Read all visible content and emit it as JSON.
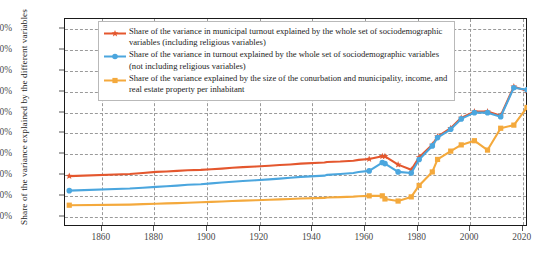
{
  "chart_data": {
    "type": "line",
    "title": "",
    "xlabel": "",
    "ylabel": "Share of the variance explained by the different variables",
    "xlim": [
      1846,
      2022
    ],
    "ylim": [
      5,
      105
    ],
    "grid": true,
    "legend_position": "top-left-inside",
    "x_ticks": [
      "1860",
      "1880",
      "1900",
      "1920",
      "1940",
      "1960",
      "1980",
      "2000",
      "2020"
    ],
    "x_tick_values": [
      1860,
      1880,
      1900,
      1920,
      1940,
      1960,
      1980,
      2000,
      2020
    ],
    "y_ticks": [
      "10%",
      "20%",
      "30%",
      "40%",
      "50%",
      "60%",
      "70%",
      "80%",
      "90%",
      "100%"
    ],
    "y_tick_values": [
      10,
      20,
      30,
      40,
      50,
      60,
      70,
      80,
      90,
      100
    ],
    "series": [
      {
        "name": "Share of the variance in municipal turnout explained by the whole set of sociodemographic variables (including religious variables)",
        "color": "#E4572E",
        "marker": "star",
        "x": [
          1848,
          1871,
          1876,
          1881,
          1885,
          1889,
          1893,
          1898,
          1902,
          1906,
          1910,
          1914,
          1919,
          1924,
          1928,
          1932,
          1936,
          1945,
          1946,
          1951,
          1956,
          1958,
          1962,
          1967,
          1968,
          1973,
          1978,
          1981,
          1986,
          1988,
          1993,
          1997,
          2002,
          2007,
          2012,
          2017,
          2022
        ],
        "y": [
          29,
          30,
          30.5,
          31,
          31.2,
          31.5,
          31.8,
          32,
          32.3,
          32.6,
          33,
          33.3,
          33.6,
          34,
          34.3,
          34.6,
          35,
          35.5,
          35.8,
          36,
          36.4,
          36.8,
          37.2,
          38.5,
          38.5,
          34.5,
          32,
          38,
          44,
          48,
          52,
          57,
          60,
          60,
          58,
          72,
          70
        ]
      },
      {
        "name": "Share of the variance in turnout explained by the whole set of sociodemographic variables (not including religious variables)",
        "color": "#4BA6DE",
        "marker": "circle",
        "x": [
          1848,
          1871,
          1876,
          1881,
          1885,
          1889,
          1893,
          1898,
          1902,
          1906,
          1910,
          1914,
          1919,
          1924,
          1928,
          1932,
          1936,
          1945,
          1946,
          1951,
          1956,
          1958,
          1962,
          1967,
          1968,
          1973,
          1978,
          1981,
          1986,
          1988,
          1993,
          1997,
          2002,
          2007,
          2012,
          2017,
          2022
        ],
        "y": [
          22,
          23,
          23.4,
          23.8,
          24.1,
          24.4,
          24.8,
          25.1,
          25.5,
          25.9,
          26.3,
          26.6,
          27,
          27.4,
          27.8,
          28.2,
          28.6,
          29.2,
          29.6,
          30,
          30.5,
          31,
          31.5,
          35.5,
          35,
          31,
          30.5,
          37,
          43.5,
          47.5,
          51.5,
          56.5,
          59.5,
          59.5,
          57.5,
          71.5,
          70.5
        ]
      },
      {
        "name": "Share of the variance explained by the size of the conurbation and municipality, income, and real estate property per inhabitant",
        "color": "#F4A93C",
        "marker": "square",
        "x": [
          1848,
          1871,
          1876,
          1881,
          1885,
          1889,
          1893,
          1898,
          1902,
          1906,
          1910,
          1914,
          1919,
          1924,
          1928,
          1932,
          1936,
          1945,
          1946,
          1951,
          1956,
          1958,
          1962,
          1967,
          1968,
          1973,
          1978,
          1981,
          1986,
          1988,
          1993,
          1997,
          2002,
          2007,
          2012,
          2017,
          2022
        ],
        "y": [
          15,
          15.3,
          15.5,
          15.7,
          15.9,
          16,
          16.2,
          16.4,
          16.6,
          16.8,
          17,
          17.2,
          17.4,
          17.6,
          17.8,
          18,
          18.2,
          18.5,
          18.7,
          18.9,
          19.1,
          19.3,
          19.5,
          19.5,
          18,
          17,
          19,
          24.5,
          31,
          37,
          41,
          44,
          46,
          41.5,
          52,
          53.5,
          62
        ]
      }
    ]
  },
  "legend": {
    "items": [
      {
        "label": "Share of the variance in municipal turnout explained by the whole set of sociodemographic variables (including religious variables)",
        "color": "#E4572E",
        "marker": "star-marker-icon"
      },
      {
        "label": "Share of the variance in turnout explained by the whole set of sociodemographic variables (not including religious variables)",
        "color": "#4BA6DE",
        "marker": "circle-marker-icon"
      },
      {
        "label": "Share of the variance explained by the size of the conurbation and municipality, income, and real estate property per inhabitant",
        "color": "#F4A93C",
        "marker": "square-marker-icon"
      }
    ]
  },
  "caption": ""
}
